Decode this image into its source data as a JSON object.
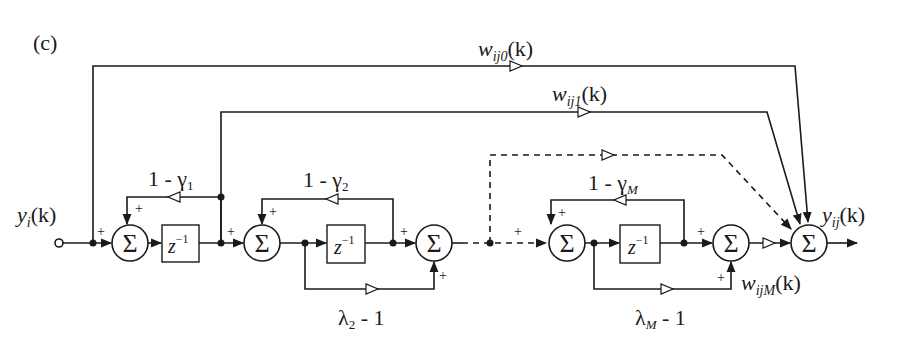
{
  "panel_label": "(c)",
  "input": {
    "label_main": "y",
    "label_sub": "i",
    "label_arg": "(k)"
  },
  "output": {
    "label_main": "y",
    "label_sub": "ij",
    "label_arg": "(k)"
  },
  "weights": {
    "w0": {
      "main": "w",
      "sub": "ij0",
      "arg": "(k)"
    },
    "w1": {
      "main": "w",
      "sub": "ij1",
      "arg": "(k)"
    },
    "wM": {
      "main": "w",
      "sub": "ijM",
      "arg": "(k)"
    }
  },
  "feedback_gains": {
    "g1": {
      "prefix": "1 - γ",
      "sub": "1"
    },
    "g2": {
      "prefix": "1 - γ",
      "sub": "2"
    },
    "gM": {
      "prefix": "1 - γ",
      "sub": "M"
    }
  },
  "feedforward_gains": {
    "l2": {
      "main": "λ",
      "sub": "2",
      "suffix": " - 1"
    },
    "lM": {
      "main": "λ",
      "sub": "M",
      "suffix": " - 1"
    }
  },
  "blocks": {
    "sum_symbol": "Σ",
    "delay": {
      "main": "z",
      "sup": "−1"
    },
    "plus": "+"
  },
  "stages": [
    {
      "id": "stage-1",
      "sum": "Σ",
      "delay": "z^-1",
      "feedback": "1 - γ1"
    },
    {
      "id": "stage-2",
      "sum": "Σ",
      "delay": "z^-1",
      "feedback": "1 - γ2",
      "feedforward": "λ2 - 1"
    },
    {
      "id": "stage-M",
      "sum": "Σ",
      "delay": "z^-1",
      "feedback": "1 - γM",
      "feedforward": "λM - 1"
    }
  ]
}
